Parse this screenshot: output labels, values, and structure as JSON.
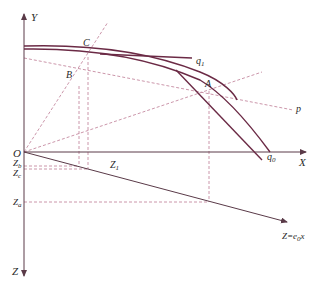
{
  "diagram": {
    "axes": {
      "y_label": "Y",
      "x_label": "X",
      "z_label": "Z",
      "origin_label": "O"
    },
    "points": {
      "A": "A",
      "B": "B",
      "C": "C"
    },
    "curves": {
      "q1_main": "q",
      "q1_sub": "1",
      "q0_main": "q",
      "q0_sub": "0",
      "p": "p"
    },
    "z_ticks": {
      "zb_main": "Z",
      "zb_sub": "b",
      "zc_main": "Z",
      "zc_sub": "c",
      "za_main": "Z",
      "za_sub": "a",
      "z1_main": "Z",
      "z1_sub": "1"
    },
    "z_line_label": {
      "prefix": "Z=e",
      "sub": "0",
      "suffix": "x"
    },
    "colors": {
      "curve": "#6b2a45",
      "dashed": "#c58aa0",
      "axis": "#5a3a48",
      "text": "#2a2a2a"
    }
  }
}
